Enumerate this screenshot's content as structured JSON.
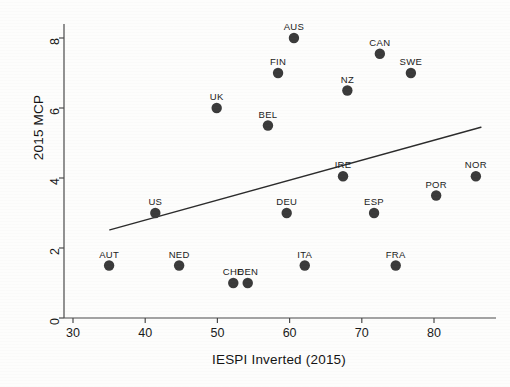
{
  "chart_data": {
    "type": "scatter",
    "title": "",
    "xlabel": "IESPI Inverted (2015)",
    "ylabel": "2015 MCP",
    "xlim": [
      27,
      86
    ],
    "ylim": [
      -0.35,
      8.6
    ],
    "xticks": [
      30,
      40,
      50,
      60,
      70,
      80
    ],
    "yticks": [
      0,
      2,
      4,
      6,
      8
    ],
    "grid": false,
    "legend": "none",
    "marker": {
      "shape": "circle",
      "color": "#3a3a3a",
      "size": 5.2
    },
    "points": [
      {
        "label": "AUT",
        "x": 35.0,
        "y": 1.5
      },
      {
        "label": "US",
        "x": 41.4,
        "y": 3.0
      },
      {
        "label": "NED",
        "x": 44.7,
        "y": 1.5
      },
      {
        "label": "UK",
        "x": 49.9,
        "y": 6.0
      },
      {
        "label": "CHE",
        "x": 52.2,
        "y": 1.0
      },
      {
        "label": "DEN",
        "x": 54.2,
        "y": 1.0
      },
      {
        "label": "BEL",
        "x": 57.0,
        "y": 5.5
      },
      {
        "label": "FIN",
        "x": 58.4,
        "y": 7.0
      },
      {
        "label": "DEU",
        "x": 59.6,
        "y": 3.0
      },
      {
        "label": "AUS",
        "x": 60.6,
        "y": 8.0
      },
      {
        "label": "ITA",
        "x": 62.1,
        "y": 1.5
      },
      {
        "label": "IRE",
        "x": 67.4,
        "y": 4.05
      },
      {
        "label": "NZ",
        "x": 68.0,
        "y": 6.5
      },
      {
        "label": "ESP",
        "x": 71.7,
        "y": 3.0
      },
      {
        "label": "CAN",
        "x": 72.5,
        "y": 7.55
      },
      {
        "label": "FRA",
        "x": 74.7,
        "y": 1.5
      },
      {
        "label": "SWE",
        "x": 76.8,
        "y": 7.0
      },
      {
        "label": "POR",
        "x": 80.3,
        "y": 3.5
      },
      {
        "label": "NOR",
        "x": 85.8,
        "y": 4.05
      }
    ],
    "fit_line": {
      "name": "linear-fit",
      "color": "#2b2b2b",
      "x_start": 35.1,
      "y_start": 2.52,
      "x_end": 86.5,
      "y_end": 5.45
    }
  },
  "axes": {
    "x_axis_color": "#4a4a4a",
    "y_axis_color": "#4a4a4a",
    "tick_length": 5
  }
}
